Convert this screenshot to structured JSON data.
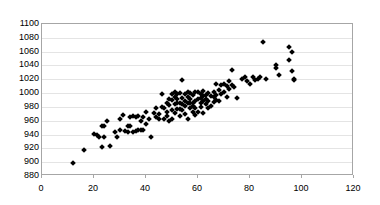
{
  "chart_data": {
    "type": "scatter",
    "title": "",
    "xlabel": "",
    "ylabel": "",
    "xlim": [
      0,
      120
    ],
    "ylim": [
      880,
      1100
    ],
    "x_ticks": [
      0,
      20,
      40,
      60,
      80,
      100,
      120
    ],
    "y_ticks": [
      880,
      900,
      920,
      940,
      960,
      980,
      1000,
      1020,
      1040,
      1060,
      1080,
      1100
    ],
    "grid": "horizontal",
    "legend": "none",
    "marker": "diamond",
    "marker_color": "#000000",
    "points": [
      [
        12,
        899
      ],
      [
        16,
        917
      ],
      [
        20,
        941
      ],
      [
        21,
        940
      ],
      [
        22,
        936
      ],
      [
        23,
        922
      ],
      [
        23,
        952
      ],
      [
        24,
        953
      ],
      [
        24,
        937
      ],
      [
        25,
        959
      ],
      [
        26,
        924
      ],
      [
        28,
        944
      ],
      [
        29,
        937
      ],
      [
        30,
        947
      ],
      [
        30,
        963
      ],
      [
        31,
        968
      ],
      [
        32,
        945
      ],
      [
        33,
        944
      ],
      [
        33,
        952
      ],
      [
        34,
        966
      ],
      [
        35,
        967
      ],
      [
        35,
        944
      ],
      [
        36,
        945
      ],
      [
        36,
        966
      ],
      [
        37,
        946
      ],
      [
        37,
        967
      ],
      [
        38,
        946
      ],
      [
        38,
        960
      ],
      [
        39,
        947
      ],
      [
        39,
        966
      ],
      [
        40,
        955
      ],
      [
        40,
        972
      ],
      [
        41,
        963
      ],
      [
        42,
        936
      ],
      [
        43,
        971
      ],
      [
        44,
        979
      ],
      [
        45,
        970
      ],
      [
        45,
        963
      ],
      [
        46,
        980
      ],
      [
        46,
        998
      ],
      [
        47,
        962
      ],
      [
        47,
        979
      ],
      [
        48,
        972
      ],
      [
        48,
        986
      ],
      [
        49,
        960
      ],
      [
        49,
        983
      ],
      [
        50,
        990
      ],
      [
        50,
        999
      ],
      [
        50,
        963
      ],
      [
        51,
        984
      ],
      [
        51,
        1001
      ],
      [
        51,
        971
      ],
      [
        52,
        986
      ],
      [
        52,
        977
      ],
      [
        52,
        999
      ],
      [
        53,
        985
      ],
      [
        53,
        967
      ],
      [
        53,
        1000
      ],
      [
        54,
        1019
      ],
      [
        54,
        984
      ],
      [
        54,
        993
      ],
      [
        55,
        982
      ],
      [
        55,
        998
      ],
      [
        55,
        970
      ],
      [
        56,
        986
      ],
      [
        56,
        1001
      ],
      [
        56,
        963
      ],
      [
        57,
        979
      ],
      [
        57,
        991
      ],
      [
        57,
        1000
      ],
      [
        58,
        985
      ],
      [
        58,
        997
      ],
      [
        58,
        973
      ],
      [
        59,
        988
      ],
      [
        59,
        1002
      ],
      [
        59,
        979
      ],
      [
        60,
        991
      ],
      [
        60,
        1001
      ],
      [
        60,
        972
      ],
      [
        61,
        986
      ],
      [
        61,
        999
      ],
      [
        61,
        980
      ],
      [
        62,
        1003
      ],
      [
        62,
        988
      ],
      [
        62,
        971
      ],
      [
        63,
        997
      ],
      [
        63,
        984
      ],
      [
        64,
        1000
      ],
      [
        64,
        989
      ],
      [
        65,
        996
      ],
      [
        65,
        981
      ],
      [
        66,
        1002
      ],
      [
        66,
        987
      ],
      [
        67,
        1013
      ],
      [
        67,
        997
      ],
      [
        68,
        1004
      ],
      [
        68,
        989
      ],
      [
        69,
        1011
      ],
      [
        69,
        999
      ],
      [
        70,
        1013
      ],
      [
        70,
        1001
      ],
      [
        71,
        1010
      ],
      [
        71,
        994
      ],
      [
        72,
        1018
      ],
      [
        72,
        1006
      ],
      [
        73,
        1034
      ],
      [
        73,
        1012
      ],
      [
        74,
        1009
      ],
      [
        75,
        993
      ],
      [
        77,
        1020
      ],
      [
        78,
        1023
      ],
      [
        79,
        1017
      ],
      [
        80,
        1013
      ],
      [
        81,
        1024
      ],
      [
        82,
        1019
      ],
      [
        83,
        1021
      ],
      [
        84,
        1024
      ],
      [
        85,
        1074
      ],
      [
        86,
        1020
      ],
      [
        90,
        1040
      ],
      [
        90,
        1037
      ],
      [
        91,
        1026
      ],
      [
        95,
        1067
      ],
      [
        95,
        1048
      ],
      [
        96,
        1060
      ],
      [
        96,
        1032
      ],
      [
        97,
        1021
      ],
      [
        97,
        1019
      ],
      [
        34,
        953
      ],
      [
        44,
        966
      ],
      [
        48,
        967
      ],
      [
        53,
        977
      ],
      [
        57,
        986
      ],
      [
        61,
        993
      ],
      [
        64,
        979
      ],
      [
        67,
        990
      ],
      [
        49,
        992
      ],
      [
        52,
        991
      ],
      [
        55,
        989
      ],
      [
        58,
        982
      ],
      [
        62,
        996
      ],
      [
        50,
        975
      ],
      [
        59,
        968
      ],
      [
        63,
        991
      ],
      [
        66,
        994
      ],
      [
        51,
        994
      ],
      [
        54,
        976
      ],
      [
        56,
        994
      ]
    ]
  }
}
